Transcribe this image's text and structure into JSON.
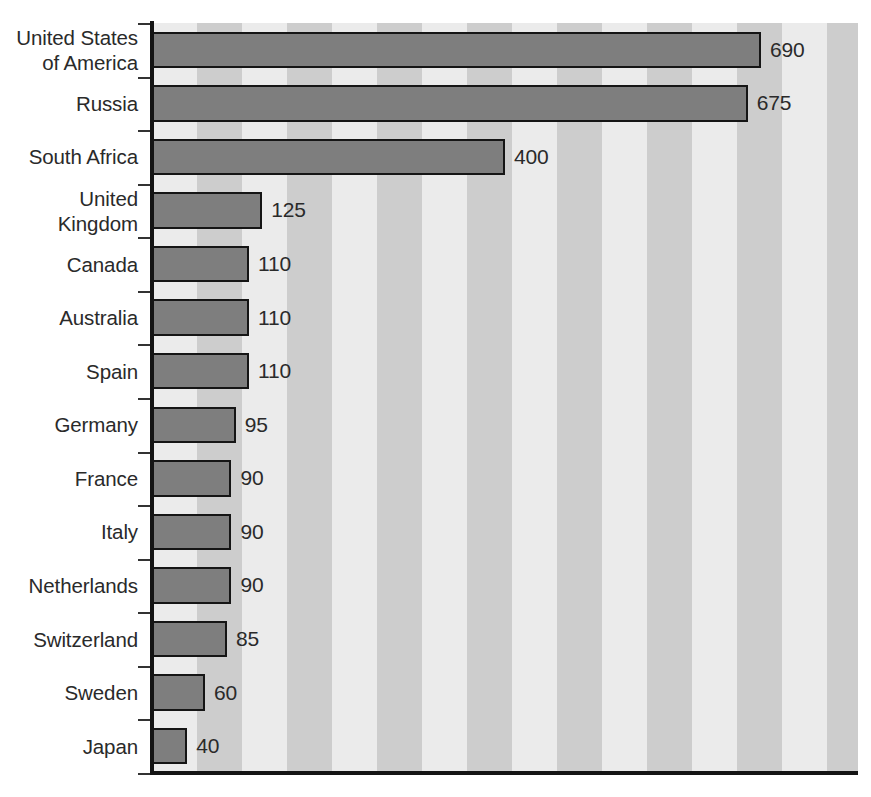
{
  "chart_data": {
    "type": "bar",
    "orientation": "horizontal",
    "title": "",
    "subtitle": "",
    "xlabel": "",
    "ylabel": "",
    "xlim": [
      0,
      800
    ],
    "ylim": null,
    "grid": false,
    "legend": null,
    "legend_position": "none",
    "categories": [
      "United States\nof America",
      "Russia",
      "South Africa",
      "United\nKingdom",
      "Canada",
      "Australia",
      "Spain",
      "Germany",
      "France",
      "Italy",
      "Netherlands",
      "Switzerland",
      "Sweden",
      "Japan"
    ],
    "values": [
      690,
      675,
      400,
      125,
      110,
      110,
      110,
      95,
      90,
      90,
      90,
      85,
      60,
      40
    ],
    "value_labels": [
      "690",
      "675",
      "400",
      "125",
      "110",
      "110",
      "110",
      "95",
      "90",
      "90",
      "90",
      "85",
      "60",
      "40"
    ],
    "bars": [
      {
        "category_line1": "United States",
        "category_line2": "of America",
        "value": 690,
        "label": "690"
      },
      {
        "category_line1": "Russia",
        "category_line2": "",
        "value": 675,
        "label": "675"
      },
      {
        "category_line1": "South Africa",
        "category_line2": "",
        "value": 400,
        "label": "400"
      },
      {
        "category_line1": "United",
        "category_line2": "Kingdom",
        "value": 125,
        "label": "125"
      },
      {
        "category_line1": "Canada",
        "category_line2": "",
        "value": 110,
        "label": "110"
      },
      {
        "category_line1": "Australia",
        "category_line2": "",
        "value": 110,
        "label": "110"
      },
      {
        "category_line1": "Spain",
        "category_line2": "",
        "value": 110,
        "label": "110"
      },
      {
        "category_line1": "Germany",
        "category_line2": "",
        "value": 95,
        "label": "95"
      },
      {
        "category_line1": "France",
        "category_line2": "",
        "value": 90,
        "label": "90"
      },
      {
        "category_line1": "Italy",
        "category_line2": "",
        "value": 90,
        "label": "90"
      },
      {
        "category_line1": "Netherlands",
        "category_line2": "",
        "value": 90,
        "label": "90"
      },
      {
        "category_line1": "Switzerland",
        "category_line2": "",
        "value": 85,
        "label": "85"
      },
      {
        "category_line1": "Sweden",
        "category_line2": "",
        "value": 60,
        "label": "60"
      },
      {
        "category_line1": "Japan",
        "category_line2": "",
        "value": 40,
        "label": "40"
      }
    ]
  },
  "style": {
    "bar_fill": "#7e7e7e",
    "bar_border": "#151515",
    "band_light": "#ebebeb",
    "band_dark": "#cdcdcd",
    "axis_color": "#141414",
    "text_color": "#2a2a2a",
    "background": "#ffffff"
  },
  "geometry": {
    "plot_left": 152,
    "plot_top": 23,
    "plot_width": 706,
    "plot_height": 750,
    "band_width": 45,
    "value_per_pixel_scale": 0.8817,
    "row_count": 14,
    "bar_height_ratio": 0.68
  }
}
